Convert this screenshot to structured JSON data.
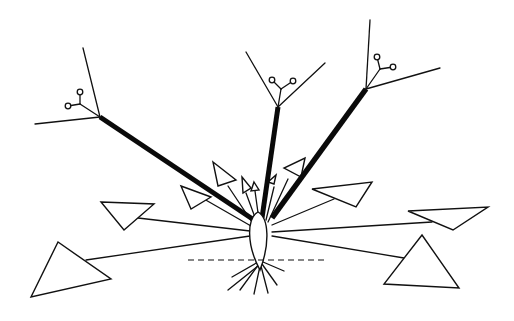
{
  "figure": {
    "type": "botanical-schematic",
    "colors": {
      "line": "#111111",
      "background": "#ffffff",
      "fill": "#ffffff"
    },
    "stem_base": {
      "cx": 258,
      "top": 212,
      "bottom": 270,
      "half_width": 11
    },
    "ground_line": {
      "y": 260,
      "x1": 188,
      "x2": 328,
      "style": "dashed"
    },
    "shoots": [
      {
        "id": "left",
        "from": [
          254,
          220
        ],
        "to": [
          100,
          117
        ],
        "width": 5,
        "twigs": [
          [
            83,
            48
          ],
          [
            35,
            124
          ]
        ],
        "bud_stalk": [
          80,
          104
        ],
        "buds": [
          [
            80,
            92
          ],
          [
            68,
            106
          ]
        ]
      },
      {
        "id": "middle",
        "from": [
          262,
          218
        ],
        "to": [
          278,
          107
        ],
        "width": 5,
        "twigs": [
          [
            246,
            52
          ],
          [
            325,
            63
          ]
        ],
        "bud_stalk": [
          281,
          89
        ],
        "buds": [
          [
            272,
            80
          ],
          [
            293,
            81
          ]
        ]
      },
      {
        "id": "right",
        "from": [
          272,
          218
        ],
        "to": [
          366,
          89
        ],
        "width": 5.5,
        "twigs": [
          [
            370,
            20
          ],
          [
            440,
            68
          ]
        ],
        "bud_stalk": [
          380,
          69
        ],
        "buds": [
          [
            377,
            57
          ],
          [
            393,
            67
          ]
        ]
      }
    ],
    "leaves": [
      {
        "id": "far-left-large",
        "petiole": [
          [
            250,
            236
          ],
          [
            86,
            260
          ]
        ],
        "triangle": [
          [
            58,
            242
          ],
          [
            31,
            297
          ],
          [
            111,
            279
          ]
        ]
      },
      {
        "id": "left-mid",
        "petiole": [
          [
            250,
            231
          ],
          [
            138,
            218
          ]
        ],
        "triangle": [
          [
            101,
            202
          ],
          [
            154,
            204
          ],
          [
            124,
            230
          ]
        ]
      },
      {
        "id": "left-upper",
        "petiole": [
          [
            251,
            226
          ],
          [
            204,
            199
          ]
        ],
        "triangle": [
          [
            181,
            186
          ],
          [
            211,
            197
          ],
          [
            191,
            209
          ]
        ]
      },
      {
        "id": "up-left-1",
        "petiole": [
          [
            252,
            222
          ],
          [
            228,
            186
          ]
        ],
        "triangle": [
          [
            213,
            162
          ],
          [
            236,
            180
          ],
          [
            218,
            186
          ]
        ]
      },
      {
        "id": "up-center-1",
        "petiole": [
          [
            256,
            220
          ],
          [
            246,
            193
          ]
        ],
        "triangle": [
          [
            242,
            177
          ],
          [
            251,
            188
          ],
          [
            243,
            193
          ]
        ]
      },
      {
        "id": "up-center-2",
        "petiole": [
          [
            259,
            220
          ],
          [
            255,
            191
          ]
        ],
        "triangle": [
          [
            254,
            182
          ],
          [
            259,
            190
          ],
          [
            251,
            191
          ]
        ]
      },
      {
        "id": "up-right-1",
        "petiole": [
          [
            266,
            220
          ],
          [
            274,
            187
          ]
        ],
        "triangle": [
          [
            276,
            175
          ],
          [
            274,
            184
          ],
          [
            268,
            182
          ]
        ]
      },
      {
        "id": "up-right-2",
        "petiole": [
          [
            268,
            222
          ],
          [
            288,
            179
          ]
        ],
        "triangle": [
          [
            305,
            158
          ],
          [
            301,
            177
          ],
          [
            284,
            168
          ]
        ]
      },
      {
        "id": "right-upper",
        "petiole": [
          [
            272,
            225
          ],
          [
            334,
            199
          ]
        ],
        "triangle": [
          [
            312,
            189
          ],
          [
            372,
            182
          ],
          [
            356,
            207
          ]
        ]
      },
      {
        "id": "right-mid",
        "petiole": [
          [
            272,
            232
          ],
          [
            432,
            222
          ]
        ],
        "triangle": [
          [
            408,
            211
          ],
          [
            488,
            207
          ],
          [
            453,
            230
          ]
        ]
      },
      {
        "id": "far-right-large",
        "petiole": [
          [
            272,
            236
          ],
          [
            404,
            258
          ]
        ],
        "triangle": [
          [
            422,
            235
          ],
          [
            459,
            288
          ],
          [
            384,
            284
          ]
        ]
      }
    ],
    "roots": [
      [
        [
          258,
          262
        ],
        [
          232,
          277
        ]
      ],
      [
        [
          259,
          264
        ],
        [
          240,
          290
        ]
      ],
      [
        [
          260,
          266
        ],
        [
          254,
          294
        ]
      ],
      [
        [
          261,
          266
        ],
        [
          268,
          293
        ]
      ],
      [
        [
          262,
          264
        ],
        [
          277,
          285
        ]
      ],
      [
        [
          263,
          262
        ],
        [
          284,
          271
        ]
      ],
      [
        [
          258,
          266
        ],
        [
          228,
          290
        ]
      ]
    ]
  }
}
